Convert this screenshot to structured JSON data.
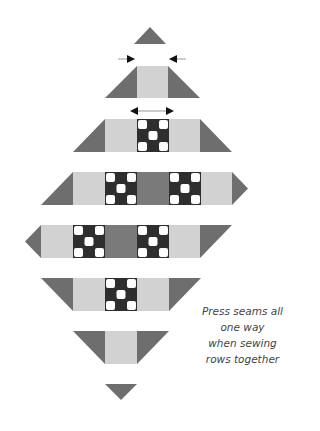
{
  "diagram": {
    "colors": {
      "dark_triangle": "#6e6e6e",
      "light_square": "#d2d2d2",
      "medium_square": "#7a7a7a",
      "ninepatch_dark": "#2e2e2e",
      "ninepatch_light": "#ffffff",
      "arrow": "#111111",
      "arrow_line": "#999999"
    },
    "unit_px": 32,
    "rows": [
      {
        "index": 1,
        "pieces": [
          "triangle-up"
        ]
      },
      {
        "index": 2,
        "pieces": [
          "triangle",
          "light-square",
          "triangle"
        ],
        "arrows": "inward"
      },
      {
        "index": 3,
        "pieces": [
          "triangle",
          "light-square",
          "nine-patch",
          "light-square",
          "triangle"
        ],
        "arrows": "outward"
      },
      {
        "index": 4,
        "pieces": [
          "triangle",
          "light-square",
          "nine-patch",
          "medium-square",
          "nine-patch",
          "light-square",
          "point-triangle"
        ]
      },
      {
        "index": 5,
        "pieces": [
          "point-triangle",
          "light-square",
          "nine-patch",
          "medium-square",
          "nine-patch",
          "light-square",
          "triangle"
        ]
      },
      {
        "index": 6,
        "pieces": [
          "triangle",
          "light-square",
          "nine-patch",
          "light-square",
          "triangle"
        ]
      },
      {
        "index": 7,
        "pieces": [
          "triangle",
          "light-square",
          "triangle"
        ]
      },
      {
        "index": 8,
        "pieces": [
          "triangle-down"
        ]
      }
    ]
  },
  "caption": {
    "lines": [
      "Press seams all",
      "one way",
      "when sewing",
      "rows together"
    ]
  }
}
